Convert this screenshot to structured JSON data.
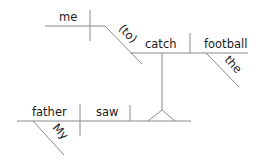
{
  "diagram": {
    "type": "sentence-diagram",
    "words": {
      "subject": "father",
      "subject_modifier": "My",
      "verb": "saw",
      "infinitive_object": "me",
      "infinitive_marker": "(to)",
      "infinitive_verb": "catch",
      "infinitive_direct_object": "football",
      "object_modifier": "the"
    },
    "colors": {
      "line": "#8a8a8a",
      "text": "#1a1a1a",
      "background": "#ffffff"
    }
  }
}
